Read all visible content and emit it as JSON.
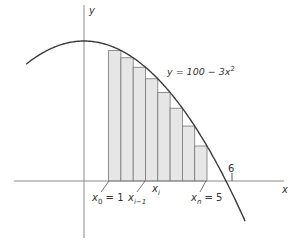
{
  "chart_data": {
    "type": "area",
    "title": "",
    "function": "y = 100 - 3x^2",
    "xlabel": "x",
    "ylabel": "y",
    "interval": [
      1,
      5
    ],
    "n_rectangles": 8,
    "x_root_label": "6",
    "rectangles": [
      {
        "x_left": 1.0,
        "x_right": 1.5,
        "height": 93.25
      },
      {
        "x_left": 1.5,
        "x_right": 2.0,
        "height": 88.0
      },
      {
        "x_left": 2.0,
        "x_right": 2.5,
        "height": 81.25
      },
      {
        "x_left": 2.5,
        "x_right": 3.0,
        "height": 73.0
      },
      {
        "x_left": 3.0,
        "x_right": 3.5,
        "height": 63.25
      },
      {
        "x_left": 3.5,
        "x_right": 4.0,
        "height": 52.0
      },
      {
        "x_left": 4.0,
        "x_right": 4.5,
        "height": 39.25
      },
      {
        "x_left": 4.5,
        "x_right": 5.0,
        "height": 25.0
      }
    ],
    "grid": false,
    "legend": null
  },
  "labels": {
    "y_axis": "y",
    "x_axis": "x",
    "equation": "y = 100 − 3x",
    "equation_exp": "2",
    "six": "6",
    "x0_base": "x",
    "x0_sub": "0",
    "x0_rest": " = 1",
    "xim1_base": "x",
    "xim1_sub": "i−1",
    "xi_base": "x",
    "xi_sub": "i",
    "xn_base": "x",
    "xn_sub": "n",
    "xn_rest": " = 5"
  },
  "colors": {
    "curve": "#3a3a3a",
    "axis": "#8a8a8a",
    "bar_fill": "#e6e6e6",
    "bar_stroke": "#777777"
  }
}
